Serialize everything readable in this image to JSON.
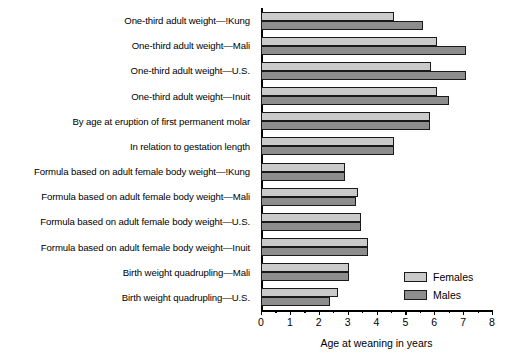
{
  "chart_data": {
    "type": "bar",
    "orientation": "horizontal",
    "title": "",
    "xlabel": "Age at weaning in years",
    "ylabel": "",
    "xlim": [
      0,
      8
    ],
    "xticks": [
      0,
      1,
      2,
      3,
      4,
      5,
      6,
      7,
      8
    ],
    "xticklabels": [
      "0",
      "1",
      "2",
      "3",
      "4",
      "5",
      "6",
      "7",
      "8"
    ],
    "grid": false,
    "legend_position": "bottom-right",
    "categories": [
      "One-third adult weight—!Kung",
      "One-third adult weight—Mali",
      "One-third adult weight—U.S.",
      "One-third adult weight—Inuit",
      "By age at eruption of first permanent molar",
      "In relation to gestation length",
      "Formula based on adult female body weight—!Kung",
      "Formula based on adult female body weight—Mali",
      "Formula based on adult female body weight—U.S.",
      "Formula based on adult female body weight—Inuit",
      "Birth weight quadrupling—Mali",
      "Birth weight quadrupling—U.S."
    ],
    "series": [
      {
        "name": "Females",
        "color": "#cacaca",
        "values": [
          4.6,
          6.1,
          5.9,
          6.1,
          5.85,
          4.6,
          2.9,
          3.35,
          3.45,
          3.7,
          3.05,
          2.65
        ]
      },
      {
        "name": "Males",
        "color": "#8d8d8d",
        "values": [
          5.6,
          7.1,
          7.1,
          6.5,
          5.85,
          4.6,
          2.9,
          3.3,
          3.45,
          3.7,
          3.05,
          2.4
        ]
      }
    ]
  },
  "legend": {
    "items": [
      {
        "label": "Females",
        "color": "#cacaca"
      },
      {
        "label": "Males",
        "color": "#8d8d8d"
      }
    ]
  }
}
